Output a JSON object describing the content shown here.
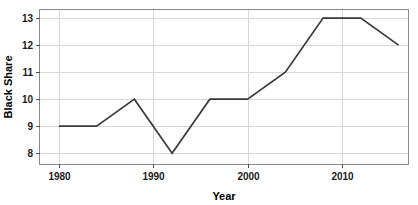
{
  "chart_data": {
    "type": "line",
    "title": "",
    "xlabel": "Year",
    "ylabel": "Black Share",
    "xlim": [
      1978,
      2017
    ],
    "ylim": [
      7.6,
      13.3
    ],
    "grid": true,
    "legend": false,
    "x_ticks": [
      1980,
      1990,
      2000,
      2010
    ],
    "x_tick_labels": [
      "1980",
      "1990",
      "2000",
      "2010"
    ],
    "y_ticks": [
      8,
      9,
      10,
      11,
      12,
      13
    ],
    "y_tick_labels": [
      "8",
      "9",
      "10",
      "11",
      "12",
      "13"
    ],
    "series": [
      {
        "name": "Black Share",
        "color": "#3a3a3a",
        "x": [
          1980,
          1984,
          1988,
          1992,
          1996,
          2000,
          2004,
          2008,
          2012,
          2016
        ],
        "values": [
          9,
          9,
          10,
          8,
          10,
          10,
          11,
          13,
          13,
          12
        ]
      }
    ]
  },
  "axes": {
    "x_title": "Year",
    "y_title": "Black Share"
  }
}
